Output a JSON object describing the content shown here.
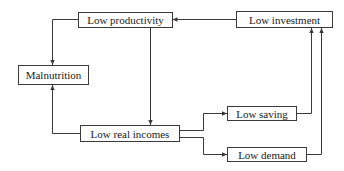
{
  "diagram": {
    "type": "flow-cycle",
    "nodes": {
      "low_productivity": "Low productivity",
      "low_investment": "Low investment",
      "malnutrition": "Malnutrition",
      "low_real_incomes": "Low real incomes",
      "low_saving": "Low saving",
      "low_demand": "Low demand"
    },
    "edges": [
      {
        "from": "Low investment",
        "to": "Low productivity"
      },
      {
        "from": "Low productivity",
        "to": "Malnutrition"
      },
      {
        "from": "Low productivity",
        "to": "Low real incomes"
      },
      {
        "from": "Low real incomes",
        "to": "Malnutrition"
      },
      {
        "from": "Low real incomes",
        "to": "Low saving"
      },
      {
        "from": "Low real incomes",
        "to": "Low demand"
      },
      {
        "from": "Low saving",
        "to": "Low investment"
      },
      {
        "from": "Low demand",
        "to": "Low investment"
      }
    ],
    "colors": {
      "line": "#3a3a3a",
      "box_border": "#3a3a3a",
      "text": "#1a1a1a",
      "background": "#ffffff"
    }
  }
}
